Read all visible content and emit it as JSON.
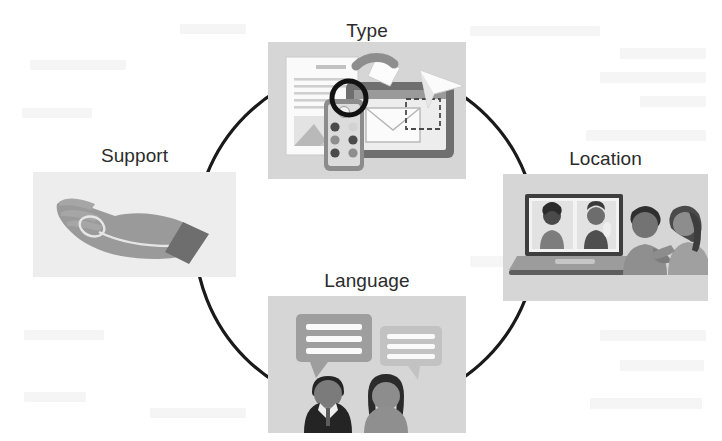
{
  "diagram": {
    "type": "circular-cycle",
    "ring_color": "#1a1a1a",
    "label_color": "#2b2b2b",
    "panel_color": "#d6d6d6",
    "panel_color_light": "#e9e9e9",
    "background_color": "#ffffff",
    "nodes": [
      {
        "id": "type",
        "label": "Type",
        "position": "top",
        "icon": "documents-devices-illustration"
      },
      {
        "id": "location",
        "label": "Location",
        "position": "right",
        "icon": "video-call-laptop-illustration"
      },
      {
        "id": "language",
        "label": "Language",
        "position": "bottom",
        "icon": "speech-bubbles-people-illustration"
      },
      {
        "id": "support",
        "label": "Support",
        "position": "left",
        "icon": "open-hand-illustration"
      }
    ]
  }
}
